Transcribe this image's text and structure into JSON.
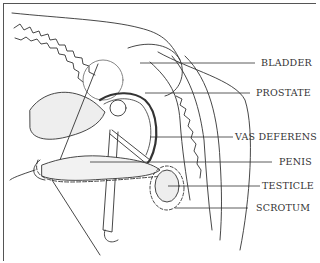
{
  "diagram": {
    "type": "anatomical line drawing",
    "line_color": "#333333",
    "labels": [
      {
        "id": "bladder",
        "text": "BLADDER"
      },
      {
        "id": "prostate",
        "text": "PROSTATE"
      },
      {
        "id": "vas-deferens",
        "text": "VAS DEFERENS"
      },
      {
        "id": "penis",
        "text": "PENIS"
      },
      {
        "id": "testicle",
        "text": "TESTICLE"
      },
      {
        "id": "scrotum",
        "text": "SCROTUM"
      }
    ]
  }
}
